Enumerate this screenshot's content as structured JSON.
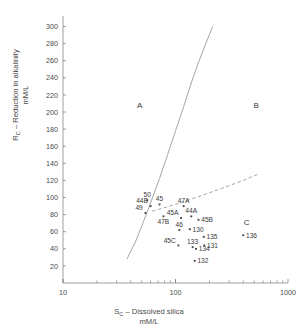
{
  "chart_data": {
    "type": "scatter",
    "title": "",
    "xlabel": "S_C – Dissolved silica mM/L",
    "ylabel": "R_C – Reduction in alkalinity mM/L",
    "xscale": "log",
    "yscale": "linear",
    "xlim": [
      10,
      1000
    ],
    "ylim": [
      0,
      310
    ],
    "grid": false,
    "legend": null,
    "xticks_major": [
      10,
      100,
      1000
    ],
    "xticklabels": [
      "10",
      "100",
      "1000"
    ],
    "yticks": [
      20,
      40,
      60,
      80,
      100,
      120,
      140,
      160,
      180,
      200,
      220,
      240,
      260,
      280,
      300
    ],
    "yticklabels": [
      "20",
      "40",
      "60",
      "80",
      "100",
      "120",
      "140",
      "160",
      "180",
      "200",
      "220",
      "240",
      "260",
      "280",
      "300"
    ],
    "regions": [
      {
        "label": "A",
        "x": 48,
        "y": 205
      },
      {
        "label": "B",
        "x": 520,
        "y": 205
      },
      {
        "label": "C",
        "x": 430,
        "y": 68
      }
    ],
    "curves": [
      {
        "name": "boundary-A-B",
        "style": "solid",
        "points": [
          [
            37,
            28
          ],
          [
            44,
            48
          ],
          [
            52,
            72
          ],
          [
            61,
            96
          ],
          [
            72,
            122
          ],
          [
            85,
            150
          ],
          [
            100,
            178
          ],
          [
            118,
            206
          ],
          [
            138,
            234
          ],
          [
            160,
            258
          ],
          [
            186,
            280
          ],
          [
            214,
            300
          ]
        ]
      },
      {
        "name": "boundary-B-C",
        "style": "dashed",
        "points": [
          [
            62,
            84
          ],
          [
            100,
            92
          ],
          [
            160,
            101
          ],
          [
            250,
            110
          ],
          [
            400,
            120
          ],
          [
            560,
            128
          ]
        ]
      }
    ],
    "points": [
      {
        "label": "50",
        "x": 56,
        "y": 97,
        "label_pos": "above"
      },
      {
        "label": "44B",
        "x": 60,
        "y": 90,
        "label_pos": "left"
      },
      {
        "label": "45",
        "x": 72,
        "y": 92,
        "label_pos": "above"
      },
      {
        "label": "49",
        "x": 54,
        "y": 82,
        "label_pos": "left"
      },
      {
        "label": "47B",
        "x": 78,
        "y": 78,
        "label_pos": "below"
      },
      {
        "label": "47A",
        "x": 118,
        "y": 90,
        "label_pos": "above"
      },
      {
        "label": "45A",
        "x": 112,
        "y": 76,
        "label_pos": "left"
      },
      {
        "label": "44A",
        "x": 138,
        "y": 78,
        "label_pos": "above"
      },
      {
        "label": "45B",
        "x": 160,
        "y": 74,
        "label_pos": "right"
      },
      {
        "label": "46",
        "x": 108,
        "y": 62,
        "label_pos": "above"
      },
      {
        "label": "130",
        "x": 134,
        "y": 63,
        "label_pos": "right"
      },
      {
        "label": "135",
        "x": 178,
        "y": 54,
        "label_pos": "right"
      },
      {
        "label": "136",
        "x": 400,
        "y": 56,
        "label_pos": "right"
      },
      {
        "label": "45C",
        "x": 106,
        "y": 44,
        "label_pos": "left"
      },
      {
        "label": "133",
        "x": 142,
        "y": 42,
        "label_pos": "above"
      },
      {
        "label": "134",
        "x": 152,
        "y": 40,
        "label_pos": "right"
      },
      {
        "label": "131",
        "x": 180,
        "y": 44,
        "label_pos": "right"
      },
      {
        "label": "132",
        "x": 148,
        "y": 26,
        "label_pos": "right"
      }
    ]
  },
  "axes": {
    "y_title_line1": "R",
    "y_title_sub": "C",
    "y_title_rest": " – Reduction in alkalinity",
    "y_title_line2": "mM/L",
    "x_title_line1": "S",
    "x_title_sub": "C",
    "x_title_rest": " – Dissolved silica",
    "x_title_line2": "mM/L"
  },
  "colors": {
    "axis": "#888888",
    "tick_text": "#4a4a4a",
    "curve": "#9a9a9a",
    "marker": "#4a4a4a",
    "background": "#ffffff"
  }
}
